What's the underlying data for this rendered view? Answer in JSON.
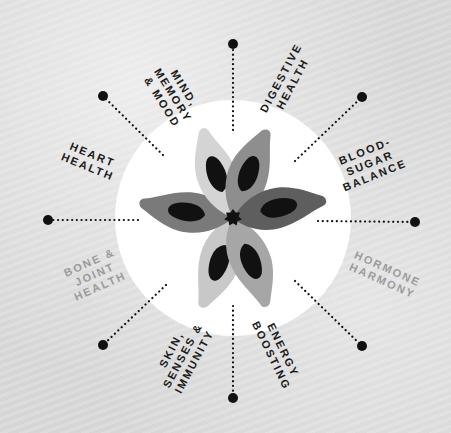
{
  "diagram": {
    "type": "radial-wheel",
    "center": {
      "x": 233,
      "y": 218
    },
    "circle_radius": 118,
    "colors": {
      "background": "#dadada",
      "circle_fill": "#ffffff",
      "spoke_color": "#111111",
      "label_dark": "#1a1a1a",
      "label_muted": "#9a9a9a",
      "petal_light": "#c8c8c8",
      "petal_mid": "#9c9c9c",
      "petal_dark": "#6e6e6e",
      "petal_seed": "#111111",
      "center_star": "#111111"
    },
    "categories": [
      {
        "id": "mind",
        "lines": [
          "MIND,",
          "MEMORY",
          "& MOOD"
        ],
        "style": "dark"
      },
      {
        "id": "digestive",
        "lines": [
          "DIGESTIVE",
          "HEALTH"
        ],
        "style": "dark"
      },
      {
        "id": "blood-sugar",
        "lines": [
          "BLOOD-",
          "SUGAR",
          "BALANCE"
        ],
        "style": "dark"
      },
      {
        "id": "hormone",
        "lines": [
          "HORMONE",
          "HARMONY"
        ],
        "style": "muted"
      },
      {
        "id": "energy",
        "lines": [
          "ENERGY",
          "BOOSTING"
        ],
        "style": "dark"
      },
      {
        "id": "skin",
        "lines": [
          "SKIN,",
          "SENSES &",
          "IMMUNITY"
        ],
        "style": "dark"
      },
      {
        "id": "bone",
        "lines": [
          "BONE &",
          "JOINT",
          "HEALTH"
        ],
        "style": "muted"
      },
      {
        "id": "heart",
        "lines": [
          "HEART",
          "HEALTH"
        ],
        "style": "dark"
      }
    ],
    "spokes": [
      {
        "direction": "N",
        "end": {
          "x": 233,
          "y": 44
        }
      },
      {
        "direction": "NE",
        "end": {
          "x": 362,
          "y": 97
        }
      },
      {
        "direction": "E",
        "end": {
          "x": 415,
          "y": 222
        }
      },
      {
        "direction": "SE",
        "end": {
          "x": 362,
          "y": 346
        }
      },
      {
        "direction": "S",
        "end": {
          "x": 233,
          "y": 398
        }
      },
      {
        "direction": "SW",
        "end": {
          "x": 103,
          "y": 345
        }
      },
      {
        "direction": "W",
        "end": {
          "x": 48,
          "y": 220
        }
      },
      {
        "direction": "NW",
        "end": {
          "x": 103,
          "y": 96
        }
      }
    ]
  }
}
